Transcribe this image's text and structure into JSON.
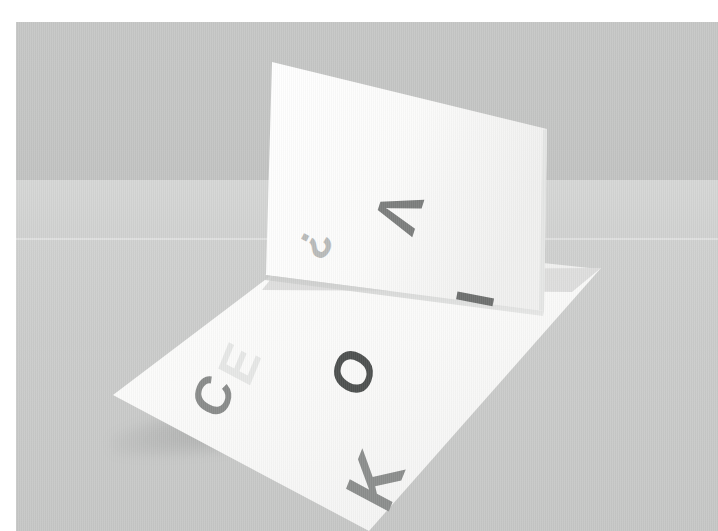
{
  "scene": {
    "title": "Folded white card standing on a gray surface",
    "subject": "folded-paper-card",
    "border_color": "#ffffff",
    "wall_color": "#c4c5c4",
    "floor_color": "#cfd0cf",
    "paper_color": "#fbfbfa",
    "paper_shadow_color": "#dcdddc",
    "horizon_y": 180
  },
  "panels": {
    "vertical": {
      "name": "upright-panel",
      "face_color": "#fbfbfa",
      "glyphs": [
        {
          "char": "?",
          "color": "#b9bbba",
          "size": 44,
          "rotate": 118,
          "x": 286,
          "y": 200,
          "name": "question-mark"
        },
        {
          "char": "V",
          "color": "#7c7e7d",
          "size": 60,
          "rotate": 108,
          "x": 362,
          "y": 160,
          "name": "letter-v"
        },
        {
          "char": "I",
          "color": "#6e706f",
          "size": 54,
          "rotate": 101,
          "x": 452,
          "y": 250,
          "name": "letter-i"
        }
      ]
    },
    "horizontal": {
      "name": "flat-panel",
      "face_color": "#fcfcfb",
      "glyphs": [
        {
          "char": "C",
          "color": "#8a8c8b",
          "size": 52,
          "rotate": 292,
          "x": 178,
          "y": 348,
          "name": "letter-c"
        },
        {
          "char": "E",
          "color": "#e6e7e6",
          "size": 52,
          "rotate": 292,
          "x": 206,
          "y": 316,
          "name": "letter-e"
        },
        {
          "char": "O",
          "color": "#4e5150",
          "size": 56,
          "rotate": 292,
          "x": 316,
          "y": 322,
          "name": "letter-o"
        },
        {
          "char": "K",
          "color": "#8c8e8d",
          "size": 70,
          "rotate": 292,
          "x": 334,
          "y": 424,
          "name": "letter-k"
        }
      ]
    }
  },
  "geometry": {
    "vertical_panel_points": "256,39 532,106 529,289 249,253",
    "horizontal_panel_points": "249,253 529,289 583,247 329,220",
    "flat_panel_points": "97,373 256,251 583,247 353,509",
    "fold_line": "256,251 583,247"
  },
  "letters_visible": [
    "?",
    "V",
    "I",
    "C",
    "E",
    "O",
    "K"
  ]
}
